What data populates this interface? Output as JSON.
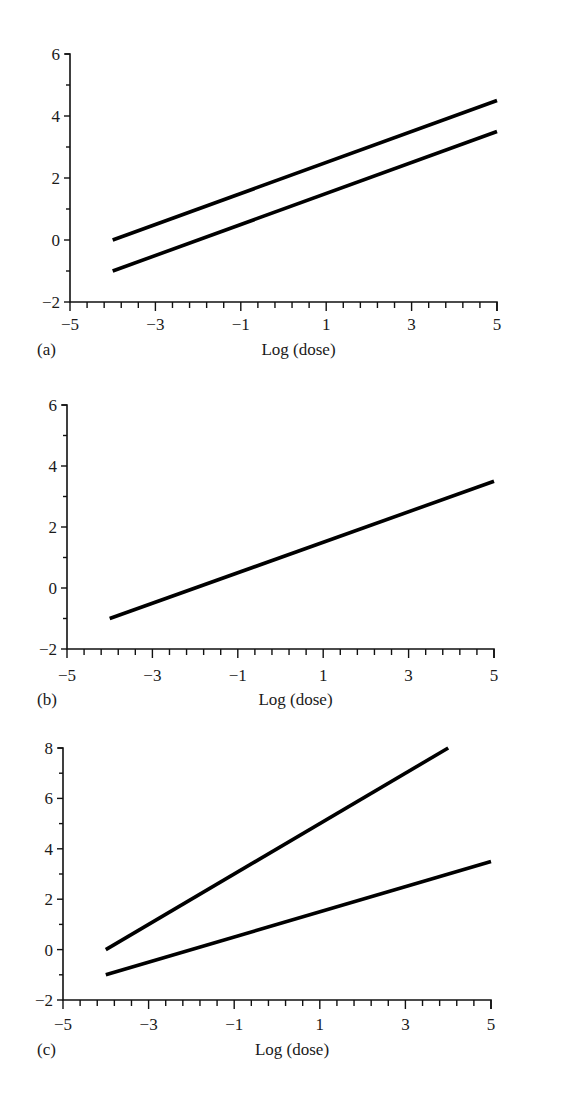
{
  "chart_data": [
    {
      "type": "line",
      "panel_label": "(a)",
      "title": "",
      "xlabel": "Log (dose)",
      "ylabel": "",
      "xlim": [
        -5,
        5
      ],
      "ylim": [
        -2,
        6
      ],
      "x_ticks": [
        "−5",
        "−3",
        "−1",
        "1",
        "3",
        "5"
      ],
      "y_ticks": [
        "−2",
        "0",
        "2",
        "4",
        "6"
      ],
      "grid": false,
      "legend": null,
      "series": [
        {
          "name": "line 1",
          "x": [
            -4,
            5
          ],
          "y": [
            0,
            4.5
          ]
        },
        {
          "name": "line 2",
          "x": [
            -4,
            5
          ],
          "y": [
            -1,
            3.5
          ]
        }
      ]
    },
    {
      "type": "line",
      "panel_label": "(b)",
      "title": "",
      "xlabel": "Log (dose)",
      "ylabel": "",
      "xlim": [
        -5,
        5
      ],
      "ylim": [
        -2,
        6
      ],
      "x_ticks": [
        "−5",
        "−3",
        "−1",
        "1",
        "3",
        "5"
      ],
      "y_ticks": [
        "−2",
        "0",
        "2",
        "4",
        "6"
      ],
      "grid": false,
      "legend": null,
      "series": [
        {
          "name": "line 1",
          "x": [
            -4,
            5
          ],
          "y": [
            -1,
            3.5
          ]
        }
      ]
    },
    {
      "type": "line",
      "panel_label": "(c)",
      "title": "",
      "xlabel": "Log (dose)",
      "ylabel": "",
      "xlim": [
        -5,
        5
      ],
      "ylim": [
        -2,
        8
      ],
      "x_ticks": [
        "−5",
        "−3",
        "−1",
        "1",
        "3",
        "5"
      ],
      "y_ticks": [
        "−2",
        "0",
        "2",
        "4",
        "6",
        "8"
      ],
      "grid": false,
      "legend": null,
      "series": [
        {
          "name": "line 1",
          "x": [
            -4,
            4
          ],
          "y": [
            0,
            8
          ]
        },
        {
          "name": "line 2",
          "x": [
            -4,
            5
          ],
          "y": [
            -1,
            3.5
          ]
        }
      ]
    }
  ],
  "layout": {
    "panels": [
      {
        "x0": 70,
        "x1": 497,
        "yTop": 54,
        "yBot": 302,
        "xlabelY": 355,
        "ticklabelY": 330,
        "panelLabelY": 337
      },
      {
        "x0": 67,
        "x1": 494,
        "yTop": 405,
        "yBot": 649,
        "xlabelY": 705,
        "ticklabelY": 681,
        "panelLabelY": 687
      },
      {
        "x0": 63,
        "x1": 491,
        "yTop": 748,
        "yBot": 1000,
        "xlabelY": 1055,
        "ticklabelY": 1030,
        "panelLabelY": 1037
      }
    ]
  }
}
